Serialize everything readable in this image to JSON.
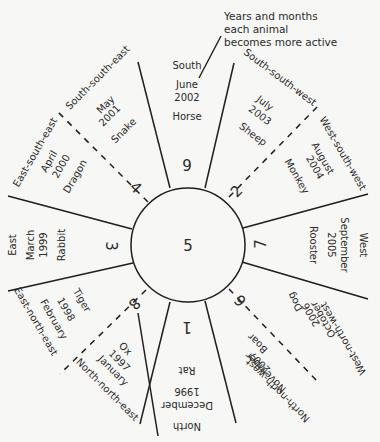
{
  "annotation": {
    "lines": [
      "Years and months",
      "each animal",
      "becomes more active"
    ]
  },
  "center": {
    "number": "5"
  },
  "sectors": [
    {
      "id": "south",
      "number": "9",
      "direction": "South",
      "month": "June",
      "year": "2002",
      "animal": "Horse"
    },
    {
      "id": "south-south-east",
      "number": "4",
      "direction": "South-south-east",
      "month": "May",
      "year": "2001",
      "animal": "Snake"
    },
    {
      "id": "east-south-east",
      "number": "4",
      "direction": "East-south-east",
      "month": "April",
      "year": "2000",
      "animal": "Dragon"
    },
    {
      "id": "east",
      "number": "3",
      "direction": "East",
      "month": "March",
      "year": "1999",
      "animal": "Rabbit"
    },
    {
      "id": "east-north-east",
      "number": "8",
      "direction": "East-north-east",
      "month": "February",
      "year": "1998",
      "animal": "Tiger"
    },
    {
      "id": "north-north-east",
      "number": "8",
      "direction": "North-north-east",
      "month": "January",
      "year": "1997",
      "animal": "Ox"
    },
    {
      "id": "north",
      "number": "1",
      "direction": "North",
      "month": "December",
      "year": "1996",
      "animal": "Rat"
    },
    {
      "id": "north-north-west",
      "number": "6",
      "direction": "North-north-west",
      "month": "November",
      "year": "2007",
      "animal": "Boar"
    },
    {
      "id": "west-north-west",
      "number": "6",
      "direction": "West-north-west",
      "month": "October",
      "year": "2006",
      "animal": "Dog"
    },
    {
      "id": "west",
      "number": "7",
      "direction": "West",
      "month": "September",
      "year": "2005",
      "animal": "Rooster"
    },
    {
      "id": "west-south-west",
      "number": "2",
      "direction": "West-south-west",
      "month": "August",
      "year": "2004",
      "animal": "Monkey"
    },
    {
      "id": "south-south-west",
      "number": "2",
      "direction": "South-south-west",
      "month": "July",
      "year": "2003",
      "animal": "Sheep"
    }
  ],
  "numbers": {
    "top": "9",
    "upper_left": "4",
    "left": "3",
    "lower_left": "8",
    "bottom": "1",
    "lower_right": "6",
    "right": "7",
    "upper_right": "2"
  },
  "colors": {
    "line": "#1e1e1e",
    "text": "#2a2a2a",
    "background": "#f7f7f5"
  }
}
